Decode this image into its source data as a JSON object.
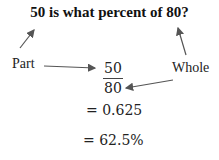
{
  "title": "50 is what percent of 80?",
  "labels": {
    "part": "Part",
    "whole": "Whole"
  },
  "fraction": {
    "numerator": "50",
    "denominator": "80"
  },
  "steps": [
    "= 0.625",
    "= 62.5%"
  ],
  "colors": {
    "text": "#222222",
    "arrow": "#555555"
  }
}
